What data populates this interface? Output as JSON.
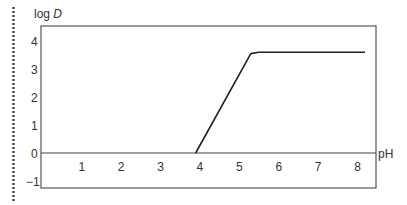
{
  "chart_data": {
    "type": "line",
    "title": "",
    "xlabel": "pH",
    "ylabel": "log D",
    "ylabel_parts": {
      "prefix": "log ",
      "var": "D"
    },
    "x_ticks": [
      "1",
      "2",
      "3",
      "4",
      "5",
      "6",
      "7",
      "8"
    ],
    "y_ticks": [
      "4",
      "3",
      "2",
      "1",
      "0",
      "−1"
    ],
    "xlim": [
      0,
      8.5
    ],
    "ylim": [
      -1.2,
      4.5
    ],
    "grid": false,
    "series": [
      {
        "name": "log D",
        "x": [
          3.9,
          5.3,
          5.5,
          8.2
        ],
        "y": [
          0,
          3.55,
          3.6,
          3.6
        ]
      }
    ]
  }
}
